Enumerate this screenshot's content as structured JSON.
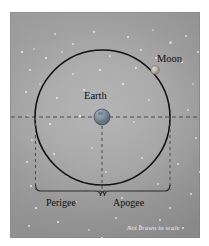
{
  "figure": {
    "note": "Not drawn to scale",
    "labels": {
      "moon": "Moon",
      "earth": "Earth",
      "perigee": "Perigee",
      "apogee": "Apogee"
    },
    "colors": {
      "background": "#ffffff",
      "panel": "#a9a9a9",
      "orbit_stroke": "#111111",
      "dashed_stroke": "#4b4b4b",
      "brace_stroke": "#2b2b2b",
      "earth_body": "#7d8a99",
      "moon_body": "#b7b3ab",
      "star": "#f2f2f2",
      "note_text": "#efefef",
      "label_text": "#101010"
    },
    "geometry": {
      "panel_x": 10,
      "panel_y": 12,
      "panel_w": 190,
      "panel_h": 226,
      "orbit_center_x": 102.5,
      "orbit_center_y": 117.5,
      "orbit_radius": 67.5,
      "earth_x": 102,
      "earth_y": 117,
      "earth_radius": 8,
      "moon_x": 155,
      "moon_y": 70,
      "moon_radius": 4,
      "axis_y": 117,
      "brace_y": 190,
      "perigee_span": [
        35,
        101
      ],
      "apogee_span": [
        102,
        170
      ]
    },
    "elements": {
      "orbit": "moon-orbit-circle",
      "major_axis": "horizontal-dashed-axis",
      "left_drop": "perigee-dashed-dropline",
      "center_drop": "earth-dashed-dropline",
      "right_drop": "apogee-dashed-dropline",
      "left_brace": "perigee-brace",
      "right_brace": "apogee-brace"
    },
    "stars": [
      {
        "x": 24,
        "y": 37,
        "r": 1.4
      },
      {
        "x": 45,
        "y": 22,
        "r": 1.0
      },
      {
        "x": 63,
        "y": 32,
        "r": 1.1
      },
      {
        "x": 84,
        "y": 20,
        "r": 0.9
      },
      {
        "x": 118,
        "y": 25,
        "r": 1.2
      },
      {
        "x": 143,
        "y": 18,
        "r": 1.0
      },
      {
        "x": 160,
        "y": 30,
        "r": 1.5
      },
      {
        "x": 176,
        "y": 24,
        "r": 1.0
      },
      {
        "x": 20,
        "y": 58,
        "r": 1.0
      },
      {
        "x": 36,
        "y": 46,
        "r": 1.3
      },
      {
        "x": 52,
        "y": 40,
        "r": 0.8
      },
      {
        "x": 100,
        "y": 44,
        "r": 0.9
      },
      {
        "x": 131,
        "y": 38,
        "r": 1.1
      },
      {
        "x": 172,
        "y": 50,
        "r": 1.2
      },
      {
        "x": 16,
        "y": 80,
        "r": 1.3
      },
      {
        "x": 30,
        "y": 72,
        "r": 0.9
      },
      {
        "x": 63,
        "y": 62,
        "r": 1.0
      },
      {
        "x": 90,
        "y": 58,
        "r": 0.8
      },
      {
        "x": 126,
        "y": 56,
        "r": 0.9
      },
      {
        "x": 146,
        "y": 46,
        "r": 1.0
      },
      {
        "x": 183,
        "y": 72,
        "r": 1.1
      },
      {
        "x": 18,
        "y": 104,
        "r": 0.9
      },
      {
        "x": 47,
        "y": 86,
        "r": 0.8
      },
      {
        "x": 74,
        "y": 78,
        "r": 0.9
      },
      {
        "x": 113,
        "y": 72,
        "r": 0.8
      },
      {
        "x": 139,
        "y": 88,
        "r": 0.9
      },
      {
        "x": 178,
        "y": 98,
        "r": 0.9
      },
      {
        "x": 22,
        "y": 128,
        "r": 1.0
      },
      {
        "x": 40,
        "y": 112,
        "r": 0.8
      },
      {
        "x": 70,
        "y": 104,
        "r": 0.8
      },
      {
        "x": 124,
        "y": 110,
        "r": 0.8
      },
      {
        "x": 158,
        "y": 120,
        "r": 0.9
      },
      {
        "x": 186,
        "y": 126,
        "r": 1.0
      },
      {
        "x": 17,
        "y": 150,
        "r": 0.9
      },
      {
        "x": 44,
        "y": 142,
        "r": 0.8
      },
      {
        "x": 82,
        "y": 136,
        "r": 0.8
      },
      {
        "x": 132,
        "y": 146,
        "r": 0.8
      },
      {
        "x": 168,
        "y": 152,
        "r": 1.2
      },
      {
        "x": 190,
        "y": 160,
        "r": 1.0
      },
      {
        "x": 21,
        "y": 174,
        "r": 1.1
      },
      {
        "x": 57,
        "y": 164,
        "r": 0.8
      },
      {
        "x": 96,
        "y": 160,
        "r": 0.8
      },
      {
        "x": 148,
        "y": 172,
        "r": 0.9
      },
      {
        "x": 181,
        "y": 182,
        "r": 1.3
      },
      {
        "x": 26,
        "y": 196,
        "r": 0.9
      },
      {
        "x": 66,
        "y": 190,
        "r": 0.8
      },
      {
        "x": 112,
        "y": 186,
        "r": 0.8
      },
      {
        "x": 160,
        "y": 196,
        "r": 0.9
      },
      {
        "x": 19,
        "y": 214,
        "r": 1.2
      },
      {
        "x": 48,
        "y": 210,
        "r": 1.0
      },
      {
        "x": 79,
        "y": 218,
        "r": 1.3
      },
      {
        "x": 106,
        "y": 206,
        "r": 0.9
      },
      {
        "x": 130,
        "y": 214,
        "r": 1.4
      },
      {
        "x": 150,
        "y": 208,
        "r": 1.0
      },
      {
        "x": 173,
        "y": 216,
        "r": 0.9
      },
      {
        "x": 34,
        "y": 228,
        "r": 0.9
      },
      {
        "x": 62,
        "y": 232,
        "r": 1.0
      },
      {
        "x": 92,
        "y": 226,
        "r": 0.8
      },
      {
        "x": 188,
        "y": 40,
        "r": 0.9
      },
      {
        "x": 12,
        "y": 40,
        "r": 0.8
      }
    ]
  }
}
